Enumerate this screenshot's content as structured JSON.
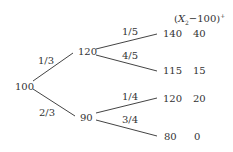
{
  "tree": {
    "root": {
      "value": "100"
    },
    "level1": [
      {
        "value": "120",
        "prob": "1/3"
      },
      {
        "value": "90",
        "prob": "2/3"
      }
    ],
    "level2": [
      {
        "value": "140",
        "prob": "1/5",
        "payoff": "40"
      },
      {
        "value": "115",
        "prob": "4/5",
        "payoff": "15"
      },
      {
        "value": "120",
        "prob": "1/4",
        "payoff": "20"
      },
      {
        "value": "80",
        "prob": "3/4",
        "payoff": "0"
      }
    ],
    "payoff_header": {
      "open": "(",
      "var": "X",
      "sub": "2",
      "rest": "−100)",
      "sup": "+"
    }
  }
}
